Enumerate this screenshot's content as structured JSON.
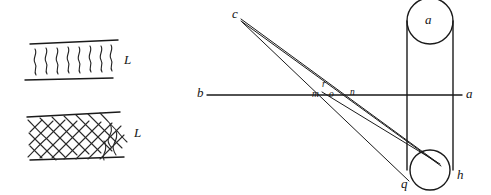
{
  "figure": {
    "kind": "hand-drawn-diagram",
    "background_color": "#ffffff",
    "ink_color": "#1a1a1a",
    "panels": [
      {
        "id": "left-panel",
        "name": "fiber-texture-panels",
        "sub_panels": [
          {
            "id": "top-band",
            "name": "wavy-fiber-band",
            "label": "L",
            "pattern": "wavy-vertical-strokes",
            "stroke_count": 8
          },
          {
            "id": "bottom-band",
            "name": "mesh-fiber-band",
            "label": "L",
            "pattern": "cross-hatched-mesh"
          }
        ]
      },
      {
        "id": "right-panel",
        "name": "optical-ray-diagram",
        "labels": {
          "apex": "c",
          "axis_left": "b",
          "axis_right": "a",
          "cylinder_top": "a",
          "center_above": "r",
          "center_left": "m",
          "center_mid": "o",
          "center_right": "n",
          "bottom_left": "q",
          "bottom_right": "h"
        }
      }
    ]
  },
  "left_panel": {
    "top_band": {
      "label": "L"
    },
    "bottom_band": {
      "label": "L"
    }
  },
  "right_panel": {
    "apex_label": "c",
    "axis_left_label": "b",
    "axis_right_label": "a",
    "cylinder_top_label": "a",
    "node_r": "r",
    "node_m": "m",
    "node_o": "o",
    "node_n": "n",
    "node_q": "q",
    "node_h": "h"
  }
}
